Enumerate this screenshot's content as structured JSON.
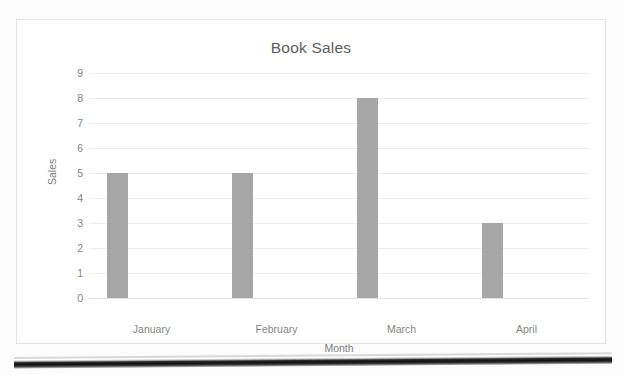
{
  "chart_data": {
    "type": "bar",
    "title": "Book Sales",
    "xlabel": "Month",
    "ylabel": "Sales",
    "categories": [
      "January",
      "February",
      "March",
      "April"
    ],
    "values": [
      5,
      5,
      8,
      3
    ],
    "yticks": [
      9,
      8,
      7,
      6,
      5,
      4,
      3,
      2,
      1,
      0
    ],
    "ylim": [
      0,
      9
    ],
    "grid": true,
    "legend": false,
    "legend_position": "none",
    "series": [
      {
        "name": "Sales",
        "values": [
          5,
          5,
          8,
          3
        ]
      }
    ]
  },
  "style": {
    "bar_color": "#a7a7a7",
    "title_color": "#5d5d5d",
    "label_color": "#848484",
    "gridline_color": "#ededed",
    "plot_background": "#ffffff",
    "page_background": "#fcfcfc",
    "border_color": "#e4e4e4"
  }
}
